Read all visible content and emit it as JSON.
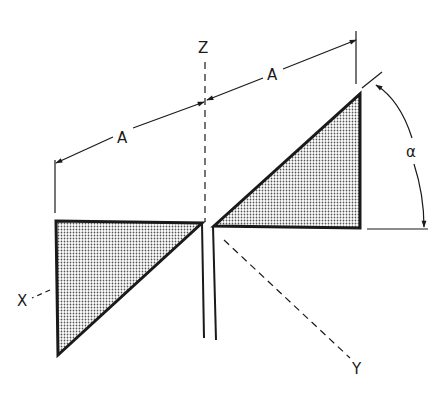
{
  "diagram": {
    "type": "bow-tie antenna geometry",
    "labels": {
      "z_axis": "Z",
      "x_axis": "X",
      "y_axis": "Y",
      "dimension_left": "A",
      "dimension_right": "A",
      "angle": "α"
    },
    "colors": {
      "line": "#1a1a1a",
      "fill_dot": "#555555",
      "background": "#ffffff"
    }
  }
}
